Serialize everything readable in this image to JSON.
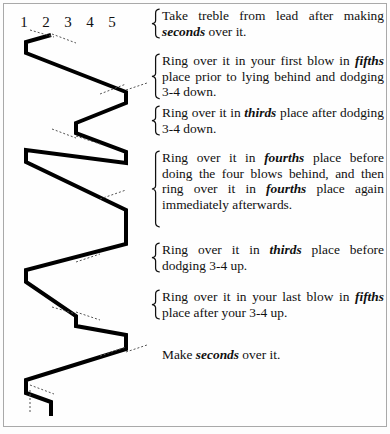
{
  "diagram": {
    "bell_numbers": [
      "1",
      "2",
      "3",
      "4",
      "5"
    ],
    "bell_number_x": [
      20,
      42,
      64,
      86,
      108
    ],
    "line_color": "#000000",
    "line_width": 4,
    "tick_color": "#555555",
    "path_points": [
      [
        47,
        31
      ],
      [
        47,
        31
      ],
      [
        22,
        38
      ],
      [
        22,
        49
      ],
      [
        122,
        88
      ],
      [
        122,
        99
      ],
      [
        72,
        119
      ],
      [
        72,
        129
      ],
      [
        122,
        148
      ],
      [
        122,
        159
      ],
      [
        22,
        146
      ],
      [
        22,
        158
      ],
      [
        122,
        206
      ],
      [
        122,
        240
      ],
      [
        22,
        266
      ],
      [
        22,
        278
      ],
      [
        72,
        312
      ],
      [
        72,
        322
      ],
      [
        122,
        331
      ],
      [
        122,
        345
      ],
      [
        22,
        376
      ],
      [
        22,
        389
      ],
      [
        47,
        398
      ],
      [
        47,
        412
      ]
    ],
    "tick_marks": [
      {
        "x1": 26,
        "y1": 26,
        "x2": 50,
        "y2": 33
      },
      {
        "x1": 48,
        "y1": 30,
        "x2": 72,
        "y2": 39
      },
      {
        "x1": 96,
        "y1": 90,
        "x2": 122,
        "y2": 80
      },
      {
        "x1": 122,
        "y1": 86,
        "x2": 146,
        "y2": 78
      },
      {
        "x1": 48,
        "y1": 125,
        "x2": 72,
        "y2": 134
      },
      {
        "x1": 72,
        "y1": 132,
        "x2": 96,
        "y2": 140
      },
      {
        "x1": 96,
        "y1": 195,
        "x2": 122,
        "y2": 186
      },
      {
        "x1": 72,
        "y1": 258,
        "x2": 96,
        "y2": 250
      },
      {
        "x1": 48,
        "y1": 303,
        "x2": 72,
        "y2": 310
      },
      {
        "x1": 72,
        "y1": 308,
        "x2": 96,
        "y2": 316
      },
      {
        "x1": 96,
        "y1": 352,
        "x2": 122,
        "y2": 343
      },
      {
        "x1": 122,
        "y1": 348,
        "x2": 146,
        "y2": 340
      },
      {
        "x1": 26,
        "y1": 381,
        "x2": 50,
        "y2": 390
      },
      {
        "x1": 26,
        "y1": 386,
        "x2": 26,
        "y2": 410
      }
    ]
  },
  "notes": [
    {
      "id": "note-1",
      "brace": true,
      "brace_lines": 2,
      "top": 2,
      "parts": [
        {
          "t": "Take treble from lead after making ",
          "b": false
        },
        {
          "t": "seconds",
          "b": true
        },
        {
          "t": " over it.",
          "b": false
        }
      ]
    },
    {
      "id": "note-2",
      "brace": true,
      "brace_lines": 3,
      "top": 14,
      "parts": [
        {
          "t": "Ring over it in your first blow in ",
          "b": false
        },
        {
          "t": "fifths",
          "b": true
        },
        {
          "t": " place prior to lying behind and dodging 3-4 down.",
          "b": false
        }
      ]
    },
    {
      "id": "note-3",
      "brace": true,
      "brace_lines": 2,
      "top": 5,
      "parts": [
        {
          "t": "Ring over it in ",
          "b": false
        },
        {
          "t": "thirds",
          "b": true
        },
        {
          "t": " place after dodging 3-4 down.",
          "b": false
        }
      ]
    },
    {
      "id": "note-4",
      "brace": true,
      "brace_lines": 5,
      "top": 14,
      "parts": [
        {
          "t": "Ring over it in ",
          "b": false
        },
        {
          "t": "fourths",
          "b": true
        },
        {
          "t": " place before doing the four blows behind, and then ring over it in ",
          "b": false
        },
        {
          "t": "fourths",
          "b": true
        },
        {
          "t": " place again immediately afterwards.",
          "b": false
        }
      ]
    },
    {
      "id": "note-5",
      "brace": true,
      "brace_lines": 2,
      "top": 14,
      "parts": [
        {
          "t": "Ring over it in ",
          "b": false
        },
        {
          "t": "thirds",
          "b": true
        },
        {
          "t": " place before dodging 3-4 up.",
          "b": false
        }
      ]
    },
    {
      "id": "note-6",
      "brace": true,
      "brace_lines": 2,
      "top": 16,
      "parts": [
        {
          "t": "Ring over it in your last blow in ",
          "b": false
        },
        {
          "t": "fifths",
          "b": true
        },
        {
          "t": " place after your 3-4 up.",
          "b": false
        }
      ]
    },
    {
      "id": "note-7",
      "brace": false,
      "brace_lines": 1,
      "top": 26,
      "parts": [
        {
          "t": "Make ",
          "b": false
        },
        {
          "t": "seconds",
          "b": true
        },
        {
          "t": " over it.",
          "b": false
        }
      ]
    }
  ]
}
